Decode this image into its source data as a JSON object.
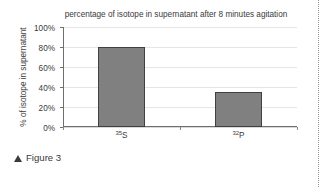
{
  "figure": {
    "caption_marker": "▲",
    "caption_text": "Figure 3"
  },
  "chart_data": {
    "type": "bar",
    "title": "percentage of isotope in supernatant after 8 minutes agitation",
    "xlabel": "",
    "ylabel": "% of isotope in supernatant",
    "categories": [
      "35S",
      "32P"
    ],
    "category_parts": [
      {
        "mass": "35",
        "element": "S"
      },
      {
        "mass": "32",
        "element": "P"
      }
    ],
    "values": [
      80,
      35
    ],
    "ylim": [
      0,
      100
    ],
    "ytick_values": [
      0,
      20,
      40,
      60,
      80,
      100
    ],
    "ytick_labels": [
      "0%",
      "20%",
      "40%",
      "60%",
      "80%",
      "100%"
    ],
    "grid": true,
    "legend": false,
    "bar_color": "#808080",
    "bar_border_color": "#404040",
    "gridline_color": "#e6e6e6",
    "axis_color": "#6f6f6f"
  }
}
